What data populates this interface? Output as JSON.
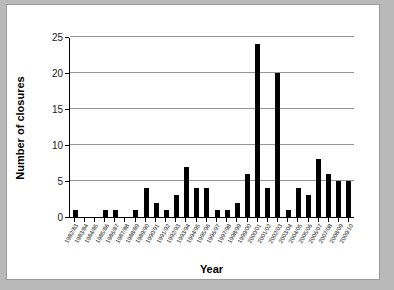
{
  "chart_data": {
    "type": "bar",
    "title": "",
    "xlabel": "Year",
    "ylabel": "Number of closures",
    "ylim": [
      0,
      25
    ],
    "yticks": [
      0,
      5,
      10,
      15,
      20,
      25
    ],
    "grid": true,
    "legend": false,
    "bar_color": "#000000",
    "categories": [
      "1982/83",
      "1983/84",
      "1984/85",
      "1985/86",
      "1986/87",
      "1987/88",
      "1988/89",
      "1989/90",
      "1990/91",
      "1991/92",
      "1992/93",
      "1993/94",
      "1994/95",
      "1995/96",
      "1996/97",
      "1997/98",
      "1998/99",
      "1999/00",
      "2000/01",
      "2001/02",
      "2002/03",
      "2003/04",
      "2004/05",
      "2005/06",
      "2006/07",
      "2007/08",
      "2008/09",
      "2009/10"
    ],
    "values": [
      1,
      0,
      0,
      1,
      1,
      0,
      1,
      4,
      2,
      1,
      3,
      7,
      4,
      4,
      1,
      1,
      2,
      6,
      24,
      4,
      20,
      1,
      4,
      3,
      8,
      6,
      5,
      5
    ]
  }
}
